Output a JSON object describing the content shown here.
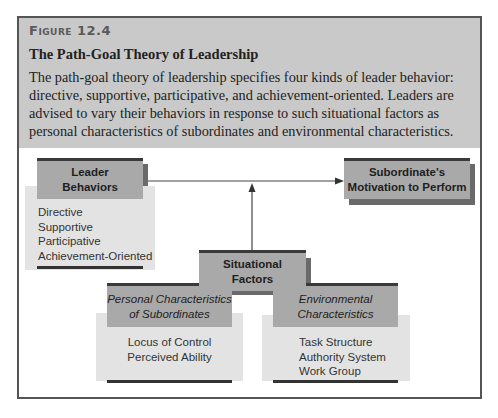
{
  "figure": {
    "label": "Figure 12.4",
    "title": "The Path-Goal Theory of Leadership",
    "description": "The path-goal theory of leadership specifies four kinds of leader behavior: directive, supportive, participative, and achievement-oriented. Leaders are advised to vary their behaviors in response to such situational factors as personal characteristics of subordinates and environmental characteristics."
  },
  "diagram": {
    "leader": {
      "title_line1": "Leader",
      "title_line2": "Behaviors",
      "items": [
        "Directive",
        "Supportive",
        "Participative",
        "Achievement-Oriented"
      ]
    },
    "outcome": {
      "title_line1": "Subordinate's",
      "title_line2": "Motivation to Perform"
    },
    "situational": {
      "title_line1": "Situational",
      "title_line2": "Factors"
    },
    "personal": {
      "title_line1": "Personal Characteristics",
      "title_line2": "of Subordinates",
      "items": [
        "Locus of Control",
        "Perceived Ability"
      ]
    },
    "environmental": {
      "title_line1": "Environmental",
      "title_line2": "Characteristics",
      "items": [
        "Task Structure",
        "Authority System",
        "Work Group"
      ]
    },
    "edges": [
      {
        "from": "Leader Behaviors",
        "to": "Subordinate's Motivation to Perform"
      },
      {
        "from": "Situational Factors",
        "to": "Leader Behaviors → Motivation link"
      }
    ],
    "colors": {
      "header_bg": "#c9c9c9",
      "box_dark": "#a9a9a9",
      "box_light": "#e3e3e3",
      "border": "#3a3a3a"
    }
  }
}
